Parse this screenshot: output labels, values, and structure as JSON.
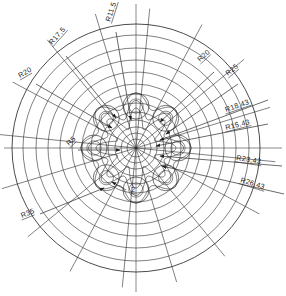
{
  "drawing": {
    "title": "Rosette radial dimension drawing",
    "sheet": {
      "width": 286,
      "height": 296,
      "background": "#ffffff"
    },
    "line_color": "#2b2b2b",
    "center": {
      "x": 136,
      "y": 148
    },
    "geometry": {
      "outer_circle_radius": 124,
      "concentric_circle_radii": [
        124,
        113,
        100,
        88,
        76,
        64,
        54,
        45,
        36,
        28,
        21,
        15,
        9
      ],
      "radial_spokes": 16,
      "petal_count": 8,
      "petal_orbit_radius": 42,
      "petal_lobe_radius": 13,
      "inner_scallop_radius": 30,
      "centerline_horizontal": true,
      "centerline_vertical": true
    },
    "dimension_labels": [
      {
        "id": "r17-5",
        "text": "R17,5",
        "x": 52,
        "y": 45,
        "rotate": -48,
        "leader": {
          "x1": 66,
          "y1": 56,
          "x2": 116,
          "y2": 118
        },
        "arrow": true
      },
      {
        "id": "r11-5",
        "text": "R11,5",
        "x": 110,
        "y": 22,
        "rotate": -72,
        "leader": {
          "x1": 116,
          "y1": 32,
          "x2": 131,
          "y2": 120
        },
        "arrow": true
      },
      {
        "id": "r20-left",
        "text": "R20",
        "x": 20,
        "y": 78,
        "rotate": -30,
        "leader": {
          "x1": 36,
          "y1": 84,
          "x2": 112,
          "y2": 128
        },
        "arrow": true
      },
      {
        "id": "r20-right",
        "text": "R20",
        "x": 200,
        "y": 62,
        "rotate": -42,
        "leader": {
          "x1": 214,
          "y1": 72,
          "x2": 160,
          "y2": 122
        },
        "arrow": true
      },
      {
        "id": "r25",
        "text": "R25",
        "x": 228,
        "y": 76,
        "rotate": -40,
        "leader": {
          "x1": 238,
          "y1": 84,
          "x2": 166,
          "y2": 134
        },
        "arrow": true
      },
      {
        "id": "r18-43",
        "text": "R18,43",
        "x": 226,
        "y": 112,
        "rotate": -19,
        "leader": {
          "x1": 268,
          "y1": 100,
          "x2": 160,
          "y2": 140
        },
        "arrow": true
      },
      {
        "id": "r15-43",
        "text": "R15,43",
        "x": 226,
        "y": 130,
        "rotate": -14,
        "leader": {
          "x1": 268,
          "y1": 124,
          "x2": 156,
          "y2": 146
        },
        "arrow": true
      },
      {
        "id": "r23-43",
        "text": "R23,43",
        "x": 236,
        "y": 160,
        "rotate": 9,
        "leader": {
          "x1": 282,
          "y1": 166,
          "x2": 160,
          "y2": 156
        },
        "arrow": true
      },
      {
        "id": "r26-43",
        "text": "R26,43",
        "x": 240,
        "y": 182,
        "rotate": 17,
        "leader": {
          "x1": 284,
          "y1": 194,
          "x2": 162,
          "y2": 166
        },
        "arrow": true
      },
      {
        "id": "r5",
        "text": "R5",
        "x": 69,
        "y": 146,
        "rotate": -42,
        "leader": {
          "x1": 78,
          "y1": 150,
          "x2": 120,
          "y2": 150
        },
        "arrow": true
      },
      {
        "id": "r35",
        "text": "R35",
        "x": 22,
        "y": 218,
        "rotate": -22,
        "leader": {
          "x1": 40,
          "y1": 214,
          "x2": 104,
          "y2": 188
        },
        "arrow": true
      },
      {
        "id": "r2",
        "text": "2",
        "x": 131,
        "y": 192,
        "rotate": 0,
        "leader": {
          "x1": 126,
          "y1": 190,
          "x2": 112,
          "y2": 182
        },
        "arrow": true
      }
    ]
  }
}
